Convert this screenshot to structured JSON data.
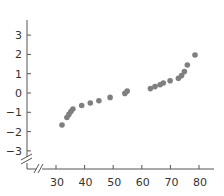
{
  "chart_data": {
    "type": "scatter",
    "title": "",
    "xlabel": "",
    "ylabel": "",
    "xlim": [
      26,
      82
    ],
    "ylim": [
      -3.3,
      3.8
    ],
    "grid": false,
    "legend": null,
    "axis_breaks": {
      "x": true,
      "y": true
    },
    "x_ticks": [
      30,
      40,
      50,
      60,
      70,
      80
    ],
    "y_ticks": [
      3,
      2,
      1,
      0,
      -1,
      -2,
      -3
    ],
    "y_tick_labels": [
      "3",
      "2",
      "1",
      "0",
      "−1",
      "−2",
      "−3"
    ],
    "x_tick_labels": [
      "30",
      "40",
      "50",
      "60",
      "70",
      "80"
    ],
    "series": [
      {
        "name": "points",
        "color": "#7f7f7f",
        "points": [
          {
            "x": 32.1,
            "y": -1.66
          },
          {
            "x": 33.8,
            "y": -1.27
          },
          {
            "x": 34.5,
            "y": -1.11
          },
          {
            "x": 35.2,
            "y": -0.96
          },
          {
            "x": 35.9,
            "y": -0.83
          },
          {
            "x": 39.0,
            "y": -0.65
          },
          {
            "x": 42.0,
            "y": -0.52
          },
          {
            "x": 45.0,
            "y": -0.4
          },
          {
            "x": 48.9,
            "y": -0.23
          },
          {
            "x": 54.1,
            "y": -0.02
          },
          {
            "x": 54.9,
            "y": 0.1
          },
          {
            "x": 63.0,
            "y": 0.23
          },
          {
            "x": 64.6,
            "y": 0.33
          },
          {
            "x": 66.4,
            "y": 0.43
          },
          {
            "x": 67.5,
            "y": 0.52
          },
          {
            "x": 69.9,
            "y": 0.63
          },
          {
            "x": 72.8,
            "y": 0.76
          },
          {
            "x": 73.9,
            "y": 0.9
          },
          {
            "x": 74.9,
            "y": 1.11
          },
          {
            "x": 75.9,
            "y": 1.45
          },
          {
            "x": 78.6,
            "y": 1.97
          }
        ]
      }
    ]
  },
  "colors": {
    "axis": "#555555",
    "text": "#333333",
    "marker": "#7f7f7f"
  }
}
